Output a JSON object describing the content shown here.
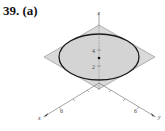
{
  "problem": {
    "number": "39.",
    "part": "(a)"
  },
  "figure": {
    "axes": {
      "x": "x",
      "y": "y",
      "z": "z"
    },
    "z_ticks": [
      "4",
      "2"
    ],
    "x_tick": "6",
    "y_tick": "6",
    "colors": {
      "plane_fill": "#d9d9d9",
      "ellipse_stroke": "#1a1a1a",
      "axis": "#555555"
    }
  }
}
